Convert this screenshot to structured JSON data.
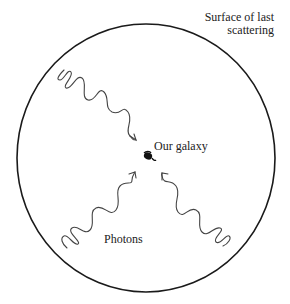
{
  "diagram": {
    "labels": {
      "surface_line1": "Surface of last",
      "surface_line2": "scattering",
      "galaxy": "Our galaxy",
      "photons": "Photons"
    },
    "elements": {
      "boundary": "surface-of-last-scattering-circle",
      "center": "galaxy-icon",
      "photon_count": 3
    },
    "colors": {
      "line": "#1a1a1a",
      "wave": "#444444",
      "text": "#222222",
      "background": "#ffffff"
    }
  }
}
